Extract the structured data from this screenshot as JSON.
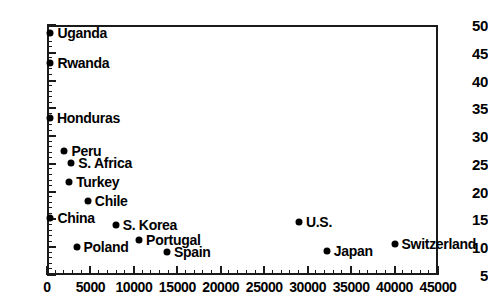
{
  "chart_data": {
    "type": "scatter",
    "title": "",
    "xlabel": "",
    "ylabel": "",
    "xlim": [
      0,
      45000
    ],
    "ylim": [
      5,
      50
    ],
    "xticks": [
      0,
      5000,
      10000,
      15000,
      20000,
      25000,
      30000,
      35000,
      40000,
      45000
    ],
    "xticklabels": [
      "0",
      "5000",
      "10000",
      "15000",
      "20000",
      "25000",
      "30000",
      "35000",
      "40000",
      "45000"
    ],
    "yticks": [
      5,
      10,
      15,
      20,
      25,
      30,
      35,
      40,
      45,
      50
    ],
    "yticklabels": [
      "5",
      "10",
      "15",
      "20",
      "25",
      "30",
      "35",
      "40",
      "45",
      "50"
    ],
    "xminor_step": 1000,
    "yminor_step": 1,
    "grid": false,
    "legend": "none",
    "marker": "filled-circle",
    "marker_color": "#000000",
    "points": [
      {
        "label": "Uganda",
        "x": 400,
        "y": 48.5,
        "label_side": "right"
      },
      {
        "label": "Rwanda",
        "x": 400,
        "y": 43.2,
        "label_side": "right"
      },
      {
        "label": "Honduras",
        "x": 350,
        "y": 33.3,
        "label_side": "right"
      },
      {
        "label": "Peru",
        "x": 2000,
        "y": 27.3,
        "label_side": "right"
      },
      {
        "label": "S. Africa",
        "x": 2800,
        "y": 25.2,
        "label_side": "right"
      },
      {
        "label": "Turkey",
        "x": 2550,
        "y": 21.7,
        "label_side": "right"
      },
      {
        "label": "Chile",
        "x": 4700,
        "y": 18.4,
        "label_side": "right"
      },
      {
        "label": "China",
        "x": 400,
        "y": 15.2,
        "label_side": "right"
      },
      {
        "label": "S. Korea",
        "x": 7900,
        "y": 14.0,
        "label_side": "right"
      },
      {
        "label": "Portugal",
        "x": 10600,
        "y": 11.3,
        "label_side": "right"
      },
      {
        "label": "Poland",
        "x": 3400,
        "y": 10.0,
        "label_side": "right"
      },
      {
        "label": "Spain",
        "x": 13800,
        "y": 9.2,
        "label_side": "right"
      },
      {
        "label": "U.S.",
        "x": 29000,
        "y": 14.5,
        "label_side": "right"
      },
      {
        "label": "Japan",
        "x": 32200,
        "y": 9.3,
        "label_side": "right"
      },
      {
        "label": "Switzerland",
        "x": 40000,
        "y": 10.6,
        "label_side": "right"
      }
    ]
  }
}
